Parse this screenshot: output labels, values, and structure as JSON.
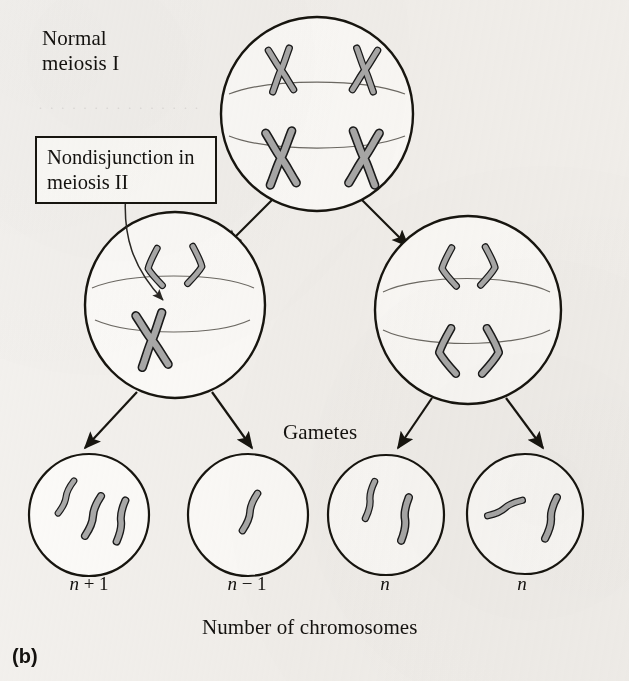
{
  "figure": {
    "panel_label": "(b)",
    "title_label": "Normal\nmeiosis I",
    "callout_label": "Nondisjunction\nin meiosis II",
    "gametes_label": "Gametes",
    "axis_caption": "Number of chromosomes",
    "background_color": "#f3f1ee",
    "ink_color": "#17150f",
    "chromosome_fill": "#a9a9a9",
    "chromosome_stroke": "#1a1a1a",
    "spindle_color": "#6d6a64"
  },
  "chart_data": {
    "type": "diagram",
    "title": "Nondisjunction in meiosis II",
    "stages": [
      {
        "id": "parent-cell",
        "label": "Normal meiosis I",
        "row": 0,
        "chromosome_count": 4,
        "chromosome_form": "replicated-X",
        "spindle": true
      },
      {
        "id": "daughter-cell-left",
        "label": "Nondisjunction in meiosis II",
        "row": 1,
        "chromosome_count": 3,
        "chromosome_form": "mixed: two separated V chromatids plus one undivided X chromosome",
        "spindle": true,
        "nondisjunction": true
      },
      {
        "id": "daughter-cell-right",
        "label": "Normal meiosis II",
        "row": 1,
        "chromosome_count": 4,
        "chromosome_form": "separated V chromatids",
        "spindle": true,
        "nondisjunction": false
      }
    ],
    "gametes": [
      {
        "id": "gamete-1",
        "ploidy": "n + 1",
        "chromosome_count": 3
      },
      {
        "id": "gamete-2",
        "ploidy": "n − 1",
        "chromosome_count": 1
      },
      {
        "id": "gamete-3",
        "ploidy": "n",
        "chromosome_count": 2
      },
      {
        "id": "gamete-4",
        "ploidy": "n",
        "chromosome_count": 2
      }
    ],
    "ploidy_labels": [
      "n + 1",
      "n − 1",
      "n",
      "n"
    ],
    "gamete_chromosome_counts": [
      3,
      1,
      2,
      2
    ],
    "arrows": [
      {
        "from": "parent-cell",
        "to": "daughter-cell-left"
      },
      {
        "from": "parent-cell",
        "to": "daughter-cell-right"
      },
      {
        "from": "daughter-cell-left",
        "to": "gamete-1"
      },
      {
        "from": "daughter-cell-left",
        "to": "gamete-2"
      },
      {
        "from": "daughter-cell-right",
        "to": "gamete-3"
      },
      {
        "from": "daughter-cell-right",
        "to": "gamete-4"
      }
    ],
    "annotations": [
      {
        "text": "Normal meiosis I",
        "target": "parent-cell"
      },
      {
        "text": "Nondisjunction in meiosis II",
        "target": "daughter-cell-left",
        "leader": "curved"
      },
      {
        "text": "Gametes",
        "target": "gamete-row"
      },
      {
        "text": "Number of chromosomes",
        "target": "ploidy-row"
      }
    ]
  }
}
